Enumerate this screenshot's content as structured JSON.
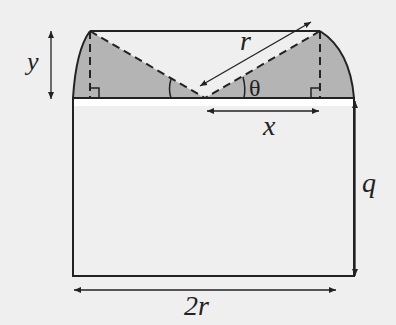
{
  "diagram": {
    "title": "",
    "colors": {
      "background": "#efefef",
      "shading": "#b4b4b4",
      "line": "#222222",
      "white_band": "#ffffff"
    },
    "labels": {
      "y": "y",
      "r": "r",
      "theta": "θ",
      "x": "x",
      "q": "q",
      "two_r": "2r"
    },
    "shapes": [
      "rectangle of width 2r and height q",
      "circular cap segment on top with two shaded triangles",
      "dashed radii from center to chord endpoints",
      "right-angle markers at both vertical dashed lines"
    ]
  }
}
